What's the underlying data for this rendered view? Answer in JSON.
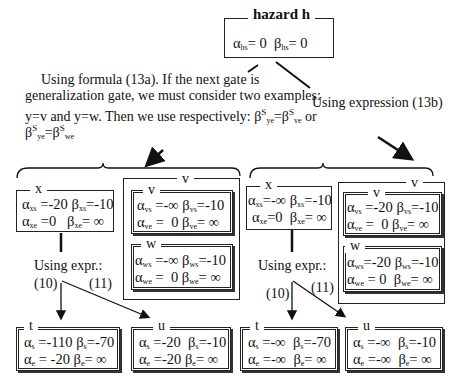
{
  "hazard": {
    "title": "hazard h",
    "row": "α_hs = 0  β_hs= 0",
    "alpha": "α",
    "alpha_sub": "hs",
    "alpha_val": "= 0",
    "beta": "β",
    "beta_sub": "hs",
    "beta_val": "= 0"
  },
  "left_note": {
    "line1": "Using formula (13a). If the next gate is",
    "line2": "generalization gate, we must consider two examples:",
    "line3": "y=v and y=w. Then we use respectively: β",
    "line4": "β"
  },
  "right_note": "Using expression  (13b)",
  "left": {
    "x": {
      "label": "x",
      "r1": "α_xs =-20 β_xs=-10",
      "r2": "α_xe =0   β_xe= ∞"
    },
    "group_label": "v",
    "v": {
      "label": "v",
      "r1": "α_vs =-∞ β_vs=-10",
      "r2": "α_ve =  0 β_ve= ∞"
    },
    "w": {
      "label": "w",
      "r1": "α_ws =-∞ β_ws=-10",
      "r2": "α_we =  0 β_we= ∞"
    },
    "expr": "Using expr.:",
    "e10": "(10)",
    "e11": "(11)",
    "t": {
      "label": "t",
      "r1": "α_s =-110 β_s=-70",
      "r2": "α_e = -20 β_e= ∞"
    },
    "u": {
      "label": "u",
      "r1": "α_s =-20  β_s=-10",
      "r2": "α_e =-20 β_e= ∞"
    }
  },
  "right": {
    "x": {
      "label": "x",
      "r1": "α_xs=-∞ β_xs=-10",
      "r2": "α_xe=0  β_xe= ∞"
    },
    "group_label": "v",
    "v": {
      "label": "v",
      "r1": "α_vs =-20 β_vs=-10",
      "r2": "α_ve =  0 β_ve= ∞"
    },
    "w": {
      "label": "w",
      "r1": "α_ws=-20 β_ws=-10",
      "r2": "α_we = 0  β_we= ∞"
    },
    "expr": "Using expr.:",
    "e10": "(10)",
    "e11": "(11)",
    "t": {
      "label": "t",
      "r1": "α_s =-∞  β_s=-70",
      "r2": "α_e =-∞  β_e= ∞"
    },
    "u": {
      "label": "u",
      "r1": "α_s =-∞  β_s=-10",
      "r2": "α_e =-∞  β_e= ∞"
    }
  }
}
